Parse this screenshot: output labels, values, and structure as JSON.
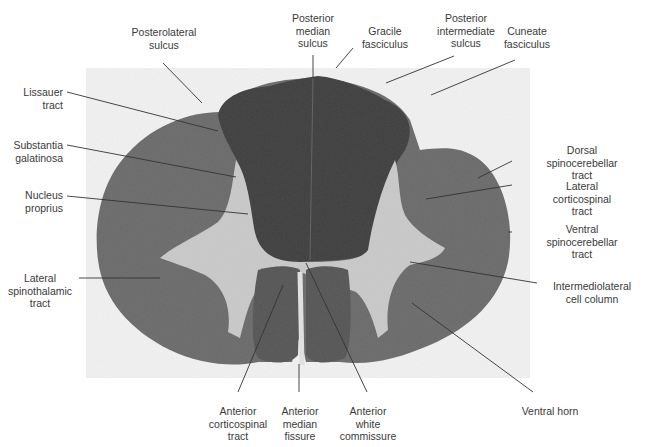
{
  "figure": {
    "colors": {
      "background": "#ffffff",
      "photo_background": "#f1f1f1",
      "white_matter": "#6a6a6a",
      "dorsal_columns": "#3e3e3e",
      "gray_matter": "#c9c9c9",
      "leader_line": "#333333",
      "label_text": "#3a3a3a"
    }
  },
  "labels": {
    "posterolateral_sulcus": "Posterolateral\nsulcus",
    "posterior_median_sulcus": "Posterior\nmedian\nsulcus",
    "gracile_fasciculus": "Gracile\nfasciculus",
    "posterior_intermediate_sulcus": "Posterior\nintermediate\nsulcus",
    "cuneate_fasciculus": "Cuneate\nfasciculus",
    "lissauer_tract": "Lissauer\ntract",
    "substantia_galatinosa": "Substantia\ngalatinosa",
    "nucleus_proprius": "Nucleus\nproprius",
    "lateral_spinothalamic_tract": "Lateral\nspinothalamic\ntract",
    "dorsal_spinocerebellar_tract": "Dorsal\nspinocerebellar\ntract",
    "lateral_corticospinal_tract": "Lateral\ncorticospinal\ntract",
    "ventral_spinocerebellar_tract": "Ventral\nspinocerebellar\ntract",
    "intermediolateral_cell_column": "Intermediolateral\ncell column",
    "anterior_corticospinal_tract": "Anterior\ncorticospinal\ntract",
    "anterior_median_fissure": "Anterior\nmedian\nfissure",
    "anterior_white_commissure": "Anterior\nwhite\ncommissure",
    "ventral_horn": "Ventral horn"
  }
}
